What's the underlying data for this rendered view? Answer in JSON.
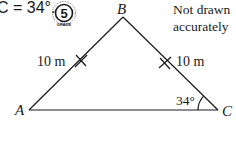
{
  "question": {
    "text_fragment": "C = 34°.",
    "grade_badge": {
      "value": "5",
      "caption": "GRADE"
    }
  },
  "note": {
    "line1": "Not drawn",
    "line2": "accurately"
  },
  "triangle": {
    "vertices": {
      "A": {
        "label": "A",
        "x": 29,
        "y": 110
      },
      "B": {
        "label": "B",
        "x": 123,
        "y": 17
      },
      "C": {
        "label": "C",
        "x": 218,
        "y": 110
      }
    },
    "sides": {
      "AB": {
        "label": "10 m",
        "equal_tick": true
      },
      "BC": {
        "label": "10 m",
        "equal_tick": true
      },
      "AC": {
        "label": ""
      }
    },
    "angles": {
      "C": {
        "label": "34°"
      }
    },
    "line_color": "#1a1a1a"
  }
}
